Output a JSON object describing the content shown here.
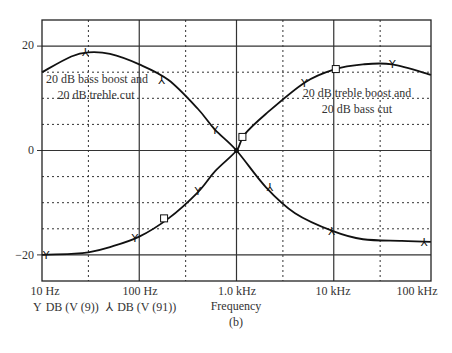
{
  "chart_data": {
    "type": "line",
    "title": "",
    "caption": "(b)",
    "xlabel": "Frequency",
    "ylabel": "",
    "xscale": "log",
    "xlim": [
      10,
      100000
    ],
    "ylim": [
      -25,
      25
    ],
    "x_ticks": [
      {
        "value": 10,
        "label": "10 Hz"
      },
      {
        "value": 100,
        "label": "100 Hz"
      },
      {
        "value": 1000,
        "label": "1.0 kHz"
      },
      {
        "value": 10000,
        "label": "10 kHz"
      },
      {
        "value": 100000,
        "label": "100 kHz"
      }
    ],
    "y_ticks": [
      {
        "value": 20,
        "label": "20"
      },
      {
        "value": 0,
        "label": "0"
      },
      {
        "value": -20,
        "label": "−20"
      }
    ],
    "grid": {
      "on": true,
      "major": "solid",
      "minor": "dotted"
    },
    "legend": [
      {
        "symbol": "Y",
        "label": "DB (V (9))"
      },
      {
        "symbol": "⅄",
        "label": "DB (V (91))"
      }
    ],
    "annotations": [
      {
        "text_line1": "20 dB bass boost and",
        "text_line2": "20 dB treble cut"
      },
      {
        "text_line1": "20 dB treble boost and",
        "text_line2": "20 dB bass cut"
      }
    ],
    "series": [
      {
        "name": "20 dB bass boost and 20 dB treble cut",
        "x": [
          10,
          20,
          30,
          50,
          100,
          200,
          400,
          600,
          1000,
          2000,
          4000,
          10000,
          20000,
          50000,
          100000
        ],
        "y": [
          15,
          18,
          18.8,
          18.5,
          16.5,
          13.5,
          8,
          4,
          0,
          -7,
          -12,
          -15.5,
          -17,
          -17.3,
          -17.5
        ]
      },
      {
        "name": "20 dB treble boost and 20 dB bass cut",
        "x": [
          10,
          20,
          30,
          50,
          100,
          200,
          400,
          600,
          1000,
          1200,
          2000,
          5000,
          10000,
          20000,
          40000,
          100000
        ],
        "y": [
          -20,
          -19.8,
          -19.5,
          -18.5,
          -16.5,
          -13,
          -8,
          -4,
          0,
          3,
          7,
          13,
          15.5,
          16.5,
          16.5,
          14.5
        ]
      }
    ]
  }
}
